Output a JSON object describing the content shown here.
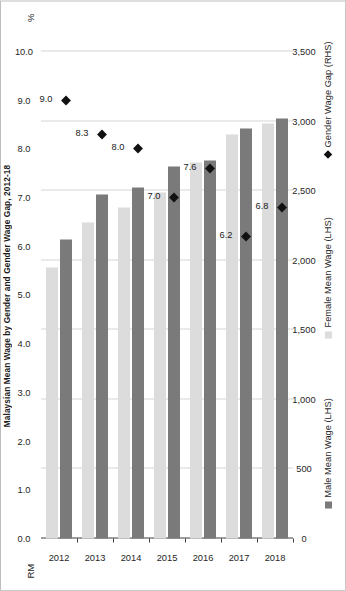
{
  "chart_data": {
    "type": "bar",
    "title": "Malaysian Mean Wage by Gender and Gender Wage Gap, 2012-18",
    "orientation": "horizontal",
    "categories": [
      "2012",
      "2013",
      "2014",
      "2015",
      "2016",
      "2017",
      "2018"
    ],
    "xlabel": "",
    "ylabel": "",
    "left_axis": {
      "unit": "RM",
      "ticks": [
        "0",
        "500",
        "1,000",
        "1,500",
        "2,000",
        "2,500",
        "3,000",
        "3,500"
      ],
      "tick_values": [
        0,
        500,
        1000,
        1500,
        2000,
        2500,
        3000,
        3500
      ],
      "min": 0,
      "max": 3500
    },
    "right_axis": {
      "unit": "%",
      "ticks": [
        "0.0",
        "1.0",
        "2.0",
        "3.0",
        "4.0",
        "5.0",
        "6.0",
        "7.0",
        "8.0",
        "9.0",
        "10.0"
      ],
      "tick_values": [
        0,
        1,
        2,
        3,
        4,
        5,
        6,
        7,
        8,
        9,
        10
      ],
      "min": 0,
      "max": 10
    },
    "grid": true,
    "legend_position": "bottom",
    "series": [
      {
        "name": "Male Mean Wage (LHS)",
        "type": "bar",
        "axis": "left",
        "color": "#7a7a7a",
        "values": [
          2150,
          2470,
          2520,
          2670,
          2720,
          2950,
          3020
        ]
      },
      {
        "name": "Female Mean Wage (LHS)",
        "type": "bar",
        "axis": "left",
        "color": "#dcdcdc",
        "values": [
          1950,
          2270,
          2380,
          2490,
          2700,
          2900,
          2980
        ]
      },
      {
        "name": "Gender Wage Gap (RHS)",
        "type": "scatter",
        "axis": "right",
        "color": "#111111",
        "values": [
          9.0,
          8.3,
          8.0,
          7.0,
          7.6,
          6.2,
          6.8
        ],
        "data_labels": [
          "9.0",
          "8.3",
          "8.0",
          "7.0",
          "7.6",
          "6.2",
          "6.8"
        ]
      }
    ]
  },
  "legend": [
    {
      "label": "Male Mean Wage (LHS)",
      "marker": "square",
      "color": "#7a7a7a"
    },
    {
      "label": "Female Mean Wage (LHS)",
      "marker": "square",
      "color": "#dcdcdc"
    },
    {
      "label": "Gender Wage Gap (RHS)",
      "marker": "diamond",
      "color": "#111111"
    }
  ]
}
